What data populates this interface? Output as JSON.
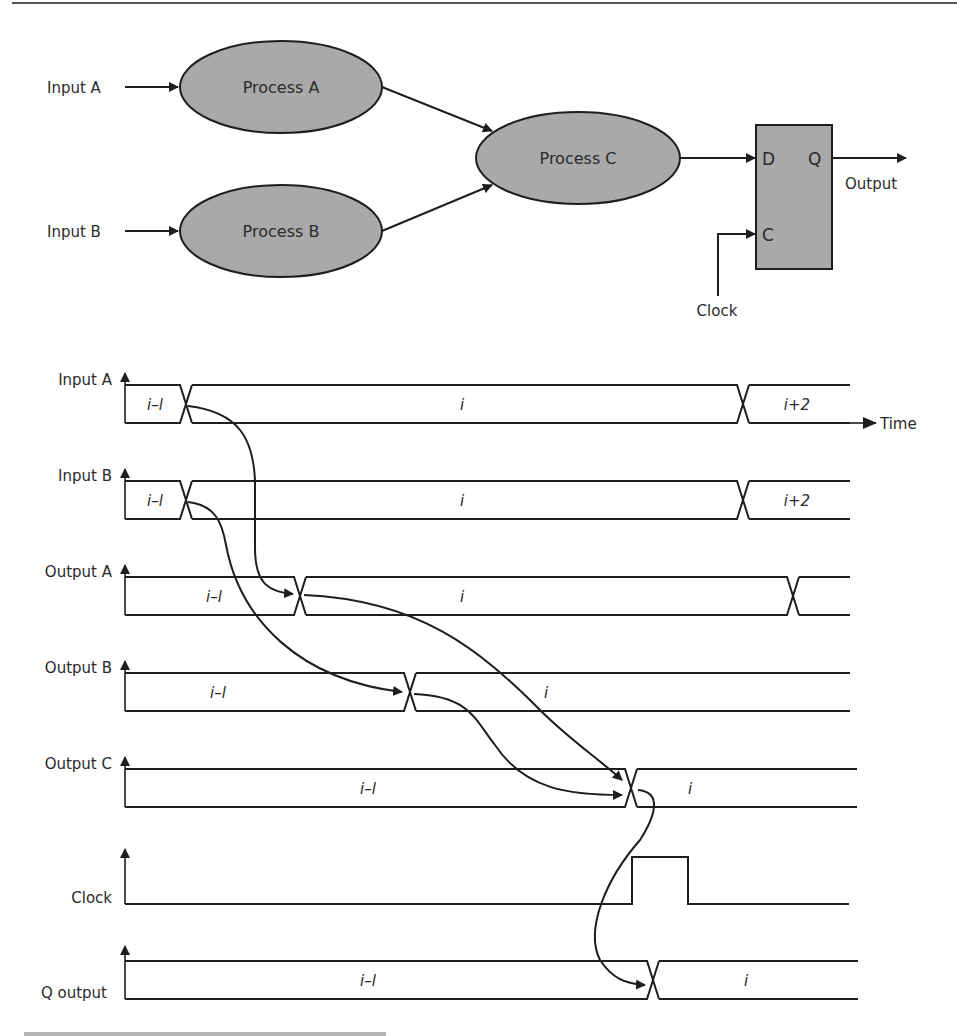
{
  "block_diagram": {
    "inputs": [
      {
        "label": "Input A"
      },
      {
        "label": "Input B"
      }
    ],
    "processes": [
      {
        "label": "Process A"
      },
      {
        "label": "Process B"
      },
      {
        "label": "Process C"
      }
    ],
    "flip_flop": {
      "d_pin": "D",
      "q_pin": "Q",
      "c_pin": "C",
      "clock_label": "Clock",
      "output_label": "Output"
    },
    "fill_color": "#a9a9a9",
    "line_color": "#1e1e1e"
  },
  "timing_diagram": {
    "time_axis_label": "Time",
    "signals": [
      {
        "name": "Input A",
        "values": [
          "i–l",
          "i",
          "i+2"
        ]
      },
      {
        "name": "Input B",
        "values": [
          "i–l",
          "i",
          "i+2"
        ]
      },
      {
        "name": "Output A",
        "values": [
          "i–l",
          "i"
        ]
      },
      {
        "name": "Output B",
        "values": [
          "i–l",
          "i"
        ]
      },
      {
        "name": "Output C",
        "values": [
          "i–l",
          "i"
        ]
      },
      {
        "name": "Clock",
        "values": []
      },
      {
        "name": "Q output",
        "values": [
          "i–l",
          "i"
        ]
      }
    ]
  }
}
